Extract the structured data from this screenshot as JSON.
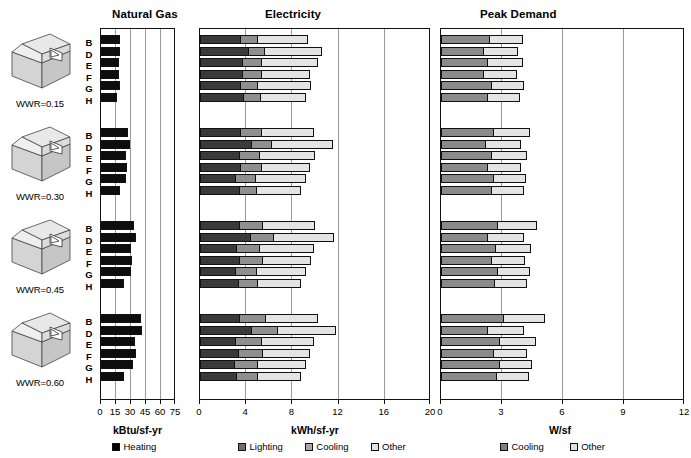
{
  "panels": [
    {
      "name": "natural-gas",
      "title": "Natural Gas",
      "axis_title": "kBtu/sf-yr",
      "ticks": [
        0,
        15,
        30,
        45,
        60,
        75
      ],
      "xmax": 75
    },
    {
      "name": "electricity",
      "title": "Electricity",
      "axis_title": "kWh/sf-yr",
      "ticks": [
        0,
        4,
        8,
        12,
        16,
        20
      ],
      "xmax": 20
    },
    {
      "name": "peak-demand",
      "title": "Peak Demand",
      "axis_title": "W/sf",
      "ticks": [
        0,
        3,
        6,
        9,
        12
      ],
      "xmax": 12
    }
  ],
  "groups": [
    {
      "icon": "building-isometric-icon",
      "label": "WWR=0.15"
    },
    {
      "icon": "building-isometric-icon",
      "label": "WWR=0.30"
    },
    {
      "icon": "building-isometric-icon",
      "label": "WWR=0.45"
    },
    {
      "icon": "building-isometric-icon",
      "label": "WWR=0.60"
    }
  ],
  "row_letters": [
    "B",
    "D",
    "E",
    "F",
    "G",
    "H"
  ],
  "legends": {
    "natural_gas": [
      {
        "label": "Heating",
        "color": "#000000"
      }
    ],
    "electricity": [
      {
        "label": "Lighting",
        "color": "#6e6e6e"
      },
      {
        "label": "Cooling",
        "color": "#a8a8a8"
      },
      {
        "label": "Other",
        "color": "#e2e2e2"
      }
    ],
    "peak_demand": [
      {
        "label": "Cooling",
        "color": "#808080"
      },
      {
        "label": "Other",
        "color": "#e2e2e2"
      }
    ]
  },
  "colors": {
    "heating": "#0d0d0d",
    "lighting": "#3a3a3a",
    "cooling_elec": "#8f8f8f",
    "other_elec": "#e4e4e4",
    "cooling_peak": "#8a8a8a",
    "other_peak": "#e4e4e4",
    "axis": "#111111",
    "grid": "#9a9a9a"
  },
  "chart_data": [
    {
      "type": "bar",
      "title": "Natural Gas",
      "xlabel": "kBtu/sf-yr",
      "ylabel": "",
      "orientation": "horizontal",
      "xlim": [
        0,
        75
      ],
      "xticks": [
        0,
        15,
        30,
        45,
        60,
        75
      ],
      "grid": true,
      "legend": [
        "Heating"
      ],
      "legend_position": "bottom",
      "group_labels": [
        "WWR=0.15",
        "WWR=0.30",
        "WWR=0.45",
        "WWR=0.60"
      ],
      "categories": [
        "B",
        "D",
        "E",
        "F",
        "G",
        "H"
      ],
      "series": [
        {
          "name": "Heating",
          "color": "#0d0d0d",
          "values_by_group": [
            [
              17.5,
              18.0,
              16.5,
              17.0,
              17.5,
              15.0
            ],
            [
              25.5,
              27.5,
              23.5,
              24.5,
              23.5,
              18.0
            ],
            [
              32.0,
              33.5,
              28.5,
              30.0,
              29.0,
              21.5
            ],
            [
              38.5,
              39.5,
              33.0,
              33.5,
              31.0,
              22.0
            ]
          ]
        }
      ]
    },
    {
      "type": "bar",
      "title": "Electricity",
      "xlabel": "kWh/sf-yr",
      "ylabel": "",
      "orientation": "horizontal",
      "stacked": true,
      "xlim": [
        0,
        20
      ],
      "xticks": [
        0,
        4,
        8,
        12,
        16,
        20
      ],
      "grid": true,
      "legend": [
        "Lighting",
        "Cooling",
        "Other"
      ],
      "legend_position": "bottom",
      "group_labels": [
        "WWR=0.15",
        "WWR=0.30",
        "WWR=0.45",
        "WWR=0.60"
      ],
      "categories": [
        "B",
        "D",
        "E",
        "F",
        "G",
        "H"
      ],
      "series": [
        {
          "name": "Lighting",
          "color": "#3a3a3a",
          "values_by_group": [
            [
              3.4,
              4.1,
              3.6,
              3.6,
              3.4,
              3.7
            ],
            [
              3.4,
              4.4,
              3.3,
              3.4,
              3.0,
              3.3
            ],
            [
              3.3,
              4.3,
              3.1,
              3.3,
              3.0,
              3.2
            ],
            [
              3.3,
              4.4,
              3.0,
              3.2,
              2.9,
              3.1
            ]
          ]
        },
        {
          "name": "Cooling",
          "color": "#8f8f8f",
          "values_by_group": [
            [
              1.5,
              1.4,
              1.6,
              1.6,
              1.5,
              1.5
            ],
            [
              1.8,
              1.7,
              1.8,
              1.8,
              1.7,
              1.5
            ],
            [
              2.0,
              2.0,
              2.0,
              2.0,
              1.8,
              1.7
            ],
            [
              2.3,
              2.2,
              2.2,
              2.1,
              2.0,
              1.8
            ]
          ]
        },
        {
          "name": "Other",
          "color": "#e4e4e4",
          "values_by_group": [
            [
              4.4,
              5.0,
              4.9,
              4.2,
              4.6,
              3.9
            ],
            [
              4.6,
              5.3,
              4.8,
              4.2,
              4.4,
              3.9
            ],
            [
              4.6,
              5.2,
              4.7,
              4.2,
              4.3,
              3.8
            ],
            [
              4.5,
              5.1,
              4.6,
              4.1,
              4.2,
              3.8
            ]
          ]
        }
      ]
    },
    {
      "type": "bar",
      "title": "Peak Demand",
      "xlabel": "W/sf",
      "ylabel": "",
      "orientation": "horizontal",
      "stacked": true,
      "xlim": [
        0,
        12
      ],
      "xticks": [
        0,
        3,
        6,
        9,
        12
      ],
      "grid": true,
      "legend": [
        "Cooling",
        "Other"
      ],
      "legend_position": "bottom",
      "group_labels": [
        "WWR=0.15",
        "WWR=0.30",
        "WWR=0.45",
        "WWR=0.60"
      ],
      "categories": [
        "B",
        "D",
        "E",
        "F",
        "G",
        "H"
      ],
      "series": [
        {
          "name": "Cooling",
          "color": "#8a8a8a",
          "values_by_group": [
            [
              2.35,
              2.05,
              2.25,
              2.05,
              2.45,
              2.25
            ],
            [
              2.55,
              2.15,
              2.45,
              2.25,
              2.55,
              2.45
            ],
            [
              2.75,
              2.25,
              2.65,
              2.45,
              2.75,
              2.6
            ],
            [
              3.05,
              2.25,
              2.85,
              2.55,
              2.85,
              2.7
            ]
          ]
        },
        {
          "name": "Other",
          "color": "#e4e4e4",
          "values_by_group": [
            [
              1.65,
              1.7,
              1.75,
              1.65,
              1.6,
              1.6
            ],
            [
              1.8,
              1.75,
              1.75,
              1.65,
              1.6,
              1.6
            ],
            [
              1.9,
              1.8,
              1.75,
              1.65,
              1.6,
              1.6
            ],
            [
              2.0,
              1.8,
              1.75,
              1.65,
              1.6,
              1.6
            ]
          ]
        }
      ]
    }
  ]
}
